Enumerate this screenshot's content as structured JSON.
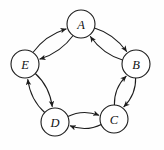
{
  "diagram": {
    "type": "directed-graph",
    "background_color": "#fefefe",
    "stroke_color": "#1c1c1c",
    "node_fill_color": "#ffffff",
    "node_radius": 14,
    "nodes": [
      {
        "id": "A",
        "label": "A",
        "cx": 81,
        "cy": 24
      },
      {
        "id": "B",
        "label": "B",
        "cx": 136,
        "cy": 64
      },
      {
        "id": "C",
        "label": "C",
        "cx": 114,
        "cy": 119
      },
      {
        "id": "D",
        "label": "D",
        "cx": 55,
        "cy": 122
      },
      {
        "id": "E",
        "label": "E",
        "cx": 25,
        "cy": 64
      }
    ],
    "edges": [
      {
        "id": "A-B",
        "from": "A",
        "to": "B",
        "direction": "clockwise",
        "ring": "outer"
      },
      {
        "id": "B-A",
        "from": "B",
        "to": "A",
        "direction": "counterclockwise",
        "ring": "inner"
      },
      {
        "id": "B-C",
        "from": "B",
        "to": "C",
        "direction": "clockwise",
        "ring": "outer"
      },
      {
        "id": "C-B",
        "from": "C",
        "to": "B",
        "direction": "counterclockwise",
        "ring": "inner"
      },
      {
        "id": "C-D",
        "from": "C",
        "to": "D",
        "direction": "clockwise",
        "ring": "outer"
      },
      {
        "id": "D-C",
        "from": "D",
        "to": "C",
        "direction": "counterclockwise",
        "ring": "inner"
      },
      {
        "id": "D-E",
        "from": "D",
        "to": "E",
        "direction": "clockwise",
        "ring": "outer"
      },
      {
        "id": "E-D",
        "from": "E",
        "to": "D",
        "direction": "counterclockwise",
        "ring": "inner"
      },
      {
        "id": "E-A",
        "from": "E",
        "to": "A",
        "direction": "clockwise",
        "ring": "outer"
      },
      {
        "id": "A-E",
        "from": "A",
        "to": "E",
        "direction": "counterclockwise",
        "ring": "inner"
      }
    ]
  }
}
